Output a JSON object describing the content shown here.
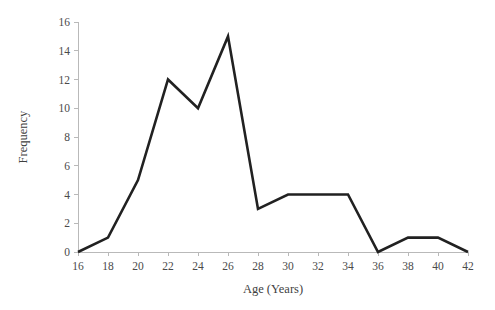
{
  "chart_data": {
    "type": "line",
    "title": "",
    "subtitle": "",
    "xlabel": "Age (Years)",
    "ylabel": "Frequency",
    "x": [
      16,
      18,
      20,
      22,
      24,
      26,
      28,
      30,
      32,
      34,
      36,
      38,
      40,
      42
    ],
    "values": [
      0,
      1,
      5,
      12,
      10,
      15,
      3,
      4,
      4,
      4,
      0,
      1,
      1,
      0
    ],
    "series": [
      {
        "name": "Frequency",
        "values": [
          0,
          1,
          5,
          12,
          10,
          15,
          3,
          4,
          4,
          4,
          0,
          1,
          1,
          0
        ]
      }
    ],
    "xlim": [
      16,
      42
    ],
    "ylim": [
      0,
      16
    ],
    "xticks": [
      16,
      18,
      20,
      22,
      24,
      26,
      28,
      30,
      32,
      34,
      36,
      38,
      40,
      42
    ],
    "yticks": [
      0,
      2,
      4,
      6,
      8,
      10,
      12,
      14,
      16
    ],
    "xtick_labels": [
      "16",
      "18",
      "20",
      "22",
      "24",
      "26",
      "28",
      "30",
      "32",
      "34",
      "36",
      "38",
      "40",
      "42"
    ],
    "ytick_labels": [
      "0",
      "2",
      "4",
      "6",
      "8",
      "10",
      "12",
      "14",
      "16"
    ],
    "grid": false,
    "legend": false,
    "legend_position": "none",
    "annotations": [],
    "colors": {
      "background": "#ffffff",
      "series_line": "#212121",
      "axis": "#b9b9b9",
      "tick_text": "#4a4a4a",
      "axis_title_text": "#3f3f3f"
    },
    "line_width": 2.6
  }
}
